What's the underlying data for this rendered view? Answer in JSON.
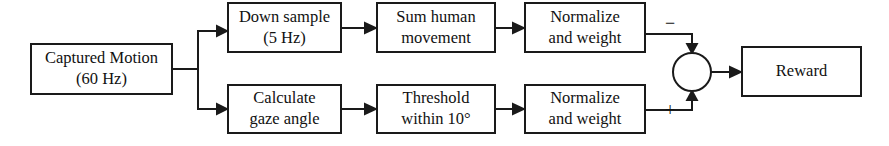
{
  "diagram": {
    "background_color": "#ffffff",
    "line_color": "#1a1a1a",
    "text_color": "#111111",
    "nodes": [
      {
        "id": "captured-motion",
        "name": "captured-motion-box",
        "shape": "rect",
        "line1": "Captured Motion",
        "line2": "(60 Hz)",
        "x": 31,
        "y": 44,
        "w": 141,
        "h": 50
      },
      {
        "id": "down-sample",
        "name": "down-sample-box",
        "shape": "rect",
        "line1": "Down sample",
        "line2": "(5 Hz)",
        "x": 228,
        "y": 3,
        "w": 113,
        "h": 49
      },
      {
        "id": "sum-human-movement",
        "name": "sum-human-movement-box",
        "shape": "rect",
        "line1": "Sum human",
        "line2": "movement",
        "x": 377,
        "y": 3,
        "w": 118,
        "h": 49
      },
      {
        "id": "normalize-weight-top",
        "name": "normalize-and-weight-top-box",
        "shape": "rect",
        "line1": "Normalize",
        "line2": "and weight",
        "x": 525,
        "y": 3,
        "w": 120,
        "h": 49
      },
      {
        "id": "calculate-gaze-angle",
        "name": "calculate-gaze-angle-box",
        "shape": "rect",
        "line1": "Calculate",
        "line2": "gaze angle",
        "x": 228,
        "y": 85,
        "w": 113,
        "h": 48
      },
      {
        "id": "threshold",
        "name": "threshold-box",
        "shape": "rect",
        "line1": "Threshold",
        "line2": "within 10°",
        "x": 377,
        "y": 85,
        "w": 118,
        "h": 48
      },
      {
        "id": "normalize-weight-bottom",
        "name": "normalize-and-weight-bottom-box",
        "shape": "rect",
        "line1": "Normalize",
        "line2": "and weight",
        "x": 525,
        "y": 85,
        "w": 120,
        "h": 48
      },
      {
        "id": "reward",
        "name": "reward-box",
        "shape": "rect",
        "line1": "Reward",
        "line2": "",
        "x": 742,
        "y": 47,
        "w": 119,
        "h": 49
      }
    ],
    "summing_junction": {
      "name": "summing-junction",
      "shape": "circle",
      "cx": 692,
      "cy": 72,
      "r": 19
    },
    "signs": [
      {
        "id": "minus",
        "name": "minus-sign-label",
        "label": "−",
        "x": 670,
        "y": 25
      },
      {
        "id": "plus",
        "name": "plus-sign-label",
        "label": "+",
        "x": 670,
        "y": 112
      }
    ],
    "edges": [
      {
        "from": "captured-motion",
        "to": "down-sample",
        "name": "edge-captured-to-downsample"
      },
      {
        "from": "captured-motion",
        "to": "calculate-gaze-angle",
        "name": "edge-captured-to-gaze"
      },
      {
        "from": "down-sample",
        "to": "sum-human-movement",
        "name": "edge-downsample-to-summovement"
      },
      {
        "from": "sum-human-movement",
        "to": "normalize-weight-top",
        "name": "edge-summovement-to-normalizetop"
      },
      {
        "from": "normalize-weight-top",
        "to": "summing-junction",
        "name": "edge-normalizetop-to-junction",
        "sign": "−"
      },
      {
        "from": "calculate-gaze-angle",
        "to": "threshold",
        "name": "edge-gaze-to-threshold"
      },
      {
        "from": "threshold",
        "to": "normalize-weight-bottom",
        "name": "edge-threshold-to-normalizebottom"
      },
      {
        "from": "normalize-weight-bottom",
        "to": "summing-junction",
        "name": "edge-normalizebottom-to-junction",
        "sign": "+"
      },
      {
        "from": "summing-junction",
        "to": "reward",
        "name": "edge-junction-to-reward"
      }
    ]
  }
}
